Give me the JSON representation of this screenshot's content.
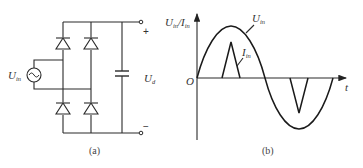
{
  "figure_a": {
    "caption": "(a)",
    "source_label": "U",
    "source_label_sub": "in",
    "output_label": "U",
    "output_label_sub": "d",
    "plus_sign": "+",
    "minus_sign": "−",
    "components": [
      "AC voltage source",
      "4 diodes (bridge rectifier)",
      "capacitor",
      "output terminals"
    ]
  },
  "figure_b": {
    "caption": "(b)",
    "y_axis_label": "U",
    "y_axis_label_sub1": "in",
    "y_axis_label_sep": "/I",
    "y_axis_label_sub2": "in",
    "x_axis_label": "t",
    "origin_label": "O",
    "voltage_curve_label": "U",
    "voltage_curve_label_sub": "in",
    "current_curve_label": "I",
    "current_curve_label_sub": "in"
  }
}
